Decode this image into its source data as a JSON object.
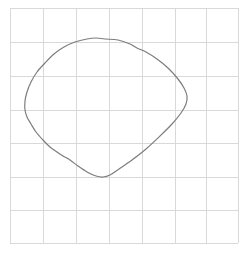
{
  "figure": {
    "title": "",
    "width": 249,
    "height": 253,
    "background_color": "#ffffff"
  },
  "grid": {
    "visible": true,
    "color": "#d9d9d9",
    "stroke_width": 1,
    "columns": 7,
    "rows": 7,
    "x_lines": [
      10,
      43,
      76,
      109,
      142,
      175,
      206,
      238
    ],
    "y_lines": [
      8,
      42,
      76,
      110,
      143,
      177,
      210,
      243
    ],
    "x_min": 10,
    "x_max": 238,
    "y_min": 8,
    "y_max": 243,
    "cell_width": 33,
    "cell_height": 33.5
  },
  "chart_data": {
    "type": "line",
    "title": "",
    "xlabel": "",
    "ylabel": "",
    "grid": true,
    "legend_position": "none",
    "xlim": [
      10,
      238
    ],
    "ylim": [
      8,
      243
    ],
    "closed": true,
    "series": [
      {
        "name": "closed-blob-curve",
        "color": "#7d7d7d",
        "stroke_width": 1.2,
        "fill": "none",
        "closed": true,
        "extrema": {
          "top": [
            105,
            39
          ],
          "left": [
            25,
            110
          ],
          "right": [
            187,
            95
          ],
          "bottom_tip": [
            103,
            177
          ]
        },
        "points": [
          [
            105,
            39
          ],
          [
            118,
            40
          ],
          [
            130,
            44
          ],
          [
            137,
            48
          ],
          [
            146,
            52
          ],
          [
            157,
            59
          ],
          [
            168,
            68
          ],
          [
            178,
            79
          ],
          [
            184,
            88
          ],
          [
            187,
            96
          ],
          [
            186,
            104
          ],
          [
            181,
            113
          ],
          [
            172,
            124
          ],
          [
            160,
            136
          ],
          [
            146,
            149
          ],
          [
            132,
            160
          ],
          [
            119,
            169
          ],
          [
            110,
            175
          ],
          [
            103,
            177
          ],
          [
            96,
            176
          ],
          [
            87,
            172
          ],
          [
            78,
            166
          ],
          [
            70,
            160
          ],
          [
            63,
            156
          ],
          [
            57,
            152
          ],
          [
            50,
            147
          ],
          [
            43,
            140
          ],
          [
            36,
            132
          ],
          [
            31,
            124
          ],
          [
            27,
            117
          ],
          [
            25,
            110
          ],
          [
            25,
            101
          ],
          [
            27,
            92
          ],
          [
            31,
            82
          ],
          [
            37,
            72
          ],
          [
            45,
            63
          ],
          [
            54,
            54
          ],
          [
            64,
            47
          ],
          [
            75,
            42
          ],
          [
            87,
            39
          ],
          [
            96,
            38
          ]
        ]
      }
    ]
  }
}
